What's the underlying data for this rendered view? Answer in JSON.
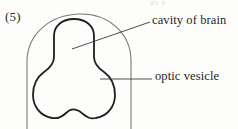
{
  "figure": {
    "number": "(5)",
    "bleed_text": "gy y",
    "outline_color": "#6e6e6e",
    "inner_color": "#1a1a1a",
    "leader_color": "#3a3a3a",
    "background": "#fdfdfc"
  },
  "labels": {
    "cavity": "cavity of brain",
    "optic": "optic vesicle"
  },
  "diagram_data": {
    "type": "anatomical-line-drawing",
    "subject": "embryonic brain cross-section",
    "parts": [
      {
        "name": "cavity of brain",
        "leader": "diagonal",
        "target_x": 72,
        "target_y": 48
      },
      {
        "name": "optic vesicle",
        "leader": "horizontal",
        "target_x": 100,
        "target_y": 79
      }
    ]
  }
}
